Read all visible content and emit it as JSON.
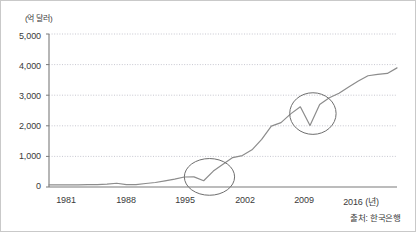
{
  "figure": {
    "background_color": "#ffffff",
    "border_color": "#c9c9c9",
    "source_note": "출처: 한국은행"
  },
  "chart_data": {
    "type": "line",
    "title": "",
    "subtitle": "",
    "xlabel": "(년)",
    "ylabel": "",
    "unit_label": "(억 달러)",
    "grid": true,
    "legend": false,
    "legend_position": "none",
    "xlim": [
      1981,
      2017
    ],
    "ylim": [
      0,
      5000
    ],
    "xticks": [
      1981,
      1988,
      1995,
      2002,
      2009,
      2016
    ],
    "xtick_labels": [
      "1981",
      "1988",
      "1995",
      "2002",
      "2009",
      "2016 (년)"
    ],
    "yticks": [
      0,
      1000,
      2000,
      3000,
      4000,
      5000
    ],
    "ytick_labels": [
      "0",
      "1,000",
      "2,000",
      "3,000",
      "4,000",
      "5,000"
    ],
    "line_color": "#8c8c8c",
    "series": [
      {
        "name": "외환보유액",
        "x": [
          1981,
          1982,
          1983,
          1984,
          1985,
          1986,
          1987,
          1988,
          1989,
          1990,
          1991,
          1992,
          1993,
          1994,
          1995,
          1996,
          1997,
          1998,
          1999,
          2000,
          2001,
          2002,
          2003,
          2004,
          2005,
          2006,
          2007,
          2008,
          2009,
          2010,
          2011,
          2012,
          2013,
          2014,
          2015,
          2016,
          2017
        ],
        "values": [
          67,
          68,
          69,
          69,
          77,
          78,
          94,
          123,
          75,
          78,
          114,
          147,
          202,
          257,
          327,
          332,
          204,
          520,
          741,
          962,
          1028,
          1214,
          1554,
          1991,
          2104,
          2390,
          2622,
          2012,
          2700,
          2916,
          3064,
          3270,
          3465,
          3636,
          3680,
          3711,
          3893
        ]
      }
    ],
    "annotations": [
      {
        "type": "ellipse",
        "name": "highlight-circle-1997",
        "center_x": 1997.6,
        "center_y": 330,
        "radius_x_years": 2.6,
        "radius_y_value": 600,
        "stroke_color": "#6e6e6e"
      },
      {
        "type": "ellipse",
        "name": "highlight-circle-2008",
        "center_x": 2008.3,
        "center_y": 2400,
        "radius_x_years": 2.4,
        "radius_y_value": 680,
        "stroke_color": "#6e6e6e"
      }
    ]
  }
}
